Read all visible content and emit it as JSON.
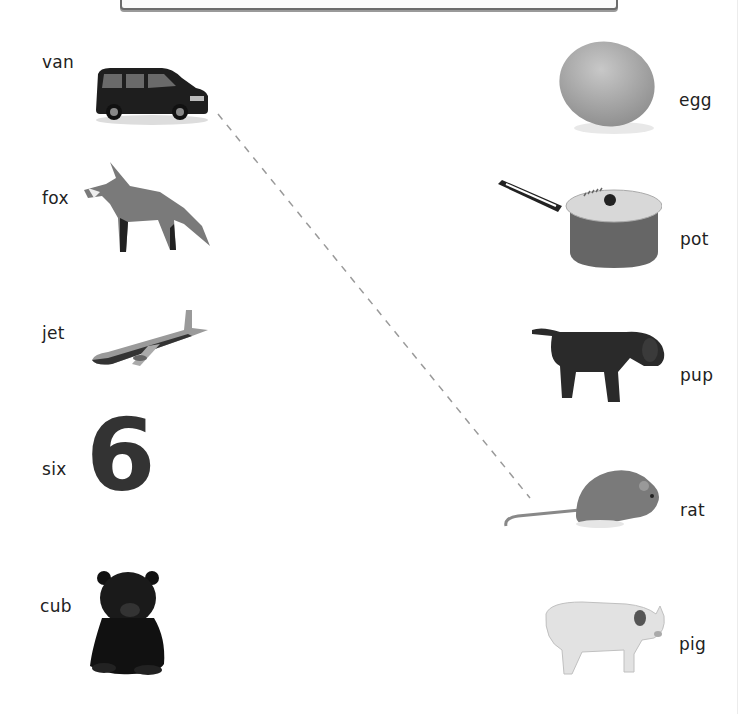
{
  "worksheet": {
    "left_column": [
      {
        "word": "van",
        "picture": "van-icon"
      },
      {
        "word": "fox",
        "picture": "fox-icon"
      },
      {
        "word": "jet",
        "picture": "jet-icon"
      },
      {
        "word": "six",
        "picture": "number-six",
        "glyph": "6"
      },
      {
        "word": "cub",
        "picture": "bear-cub-icon"
      }
    ],
    "right_column": [
      {
        "word": "egg",
        "picture": "egg-icon"
      },
      {
        "word": "pot",
        "picture": "pot-icon"
      },
      {
        "word": "pup",
        "picture": "puppy-icon"
      },
      {
        "word": "rat",
        "picture": "rat-icon"
      },
      {
        "word": "pig",
        "picture": "pig-icon"
      }
    ],
    "connections": [
      {
        "from": "van",
        "to": "rat",
        "style": "dashed"
      }
    ],
    "colors": {
      "text": "#222222",
      "line": "#9a9a9a",
      "six": "#333333"
    }
  }
}
